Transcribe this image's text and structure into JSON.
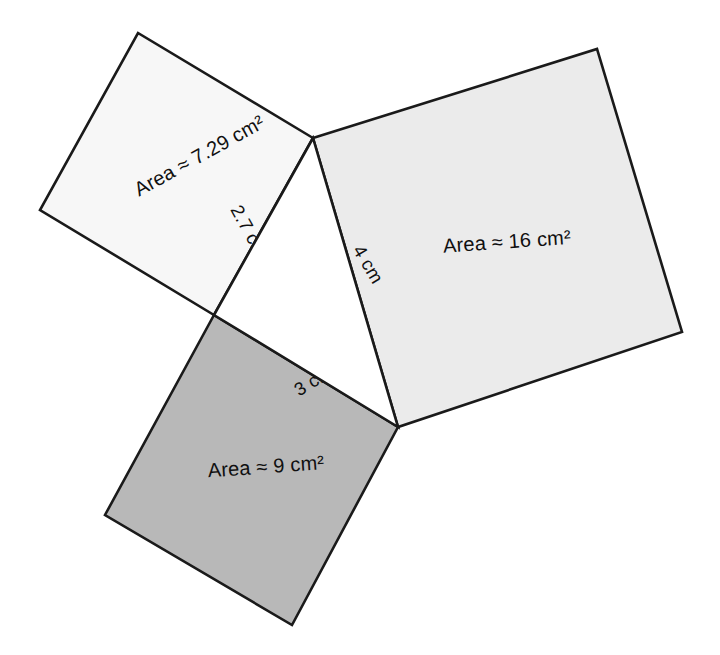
{
  "figure": {
    "background_color": "#ffffff",
    "stroke_color": "#1a1a1a"
  },
  "squares": [
    {
      "id": "square-small-top-left",
      "area_label": "Area ≈ 7.29 cm²",
      "area_value": 7.29,
      "side_length_label": "2.7 cm",
      "side_length_value": 2.7,
      "unit": "cm",
      "fill_color": "#f7f7f7",
      "label_x": 200,
      "label_y": 157,
      "label_rotation": -29,
      "side_label_x": 248,
      "side_label_y": 232,
      "side_label_rotation": 61,
      "points": "313,138 138,33 40,210 214,315"
    },
    {
      "id": "square-large-right",
      "area_label": "Area ≈ 16 cm²",
      "area_value": 16,
      "side_length_label": "4 cm",
      "side_length_value": 4,
      "unit": "cm",
      "fill_color": "#ebebeb",
      "label_x": 507,
      "label_y": 243,
      "label_rotation": -4,
      "side_label_x": 367,
      "side_label_y": 265,
      "side_label_rotation": 59,
      "points": "313,138 597,49 682,332 398,427"
    },
    {
      "id": "square-medium-bottom",
      "area_label": "Area ≈ 9 cm²",
      "area_value": 9,
      "side_length_label": "3 cm",
      "side_length_value": 3,
      "unit": "cm",
      "fill_color": "#b8b8b8",
      "label_x": 266,
      "label_y": 468,
      "label_rotation": -4,
      "side_label_x": 314,
      "side_label_y": 382,
      "side_label_rotation": -31,
      "points": "214,315 398,427 292,625 105,515"
    }
  ],
  "triangle": {
    "id": "central-right-triangle",
    "vertices": {
      "top": {
        "x": 313,
        "y": 138
      },
      "left": {
        "x": 214,
        "y": 315
      },
      "bottom_right": {
        "x": 398,
        "y": 427
      }
    },
    "fill_color": "#ffffff"
  }
}
